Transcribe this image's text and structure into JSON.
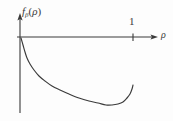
{
  "figure": {
    "name": "beta-function-plot",
    "background_color": "#fdfdfd",
    "line_color": "#3a3a3a",
    "y_axis_label_main": "f",
    "y_axis_label_subscript": "β",
    "y_axis_label_open_paren": "(",
    "y_axis_label_arg": "ρ",
    "y_axis_label_close_paren": ")",
    "x_axis_label": "ρ",
    "x_tick_label": "1"
  },
  "chart_data": {
    "type": "line",
    "title": "",
    "subtitle": "",
    "xlabel": "ρ",
    "ylabel": "f_β(ρ)",
    "grid": false,
    "legend": null,
    "axis_style": "arrowed-cartesian",
    "x_ticks": [
      {
        "value": 1,
        "label": "1",
        "px": 133
      }
    ],
    "y_ticks": [],
    "xlim": [
      0,
      1.18
    ],
    "ylim": [
      -1.0,
      0.24
    ],
    "origin_px": {
      "x": 20,
      "y": 37
    },
    "x_axis_px": {
      "x_start": 17,
      "x_end": 157,
      "y": 37
    },
    "y_axis_px": {
      "y_start": 14,
      "y_end": 113,
      "x": 20
    },
    "series": [
      {
        "name": "f_beta(rho)",
        "color": "#3a3a3a",
        "points_px": [
          {
            "x": 21,
            "y": 38
          },
          {
            "x": 23,
            "y": 45
          },
          {
            "x": 25,
            "y": 52
          },
          {
            "x": 27,
            "y": 58
          },
          {
            "x": 30,
            "y": 64
          },
          {
            "x": 34,
            "y": 70
          },
          {
            "x": 39,
            "y": 76
          },
          {
            "x": 45,
            "y": 81
          },
          {
            "x": 52,
            "y": 86
          },
          {
            "x": 60,
            "y": 90
          },
          {
            "x": 69,
            "y": 94
          },
          {
            "x": 79,
            "y": 98
          },
          {
            "x": 89,
            "y": 101
          },
          {
            "x": 98,
            "y": 103
          },
          {
            "x": 106,
            "y": 105
          },
          {
            "x": 112,
            "y": 105
          },
          {
            "x": 118,
            "y": 104
          },
          {
            "x": 123,
            "y": 102
          },
          {
            "x": 127,
            "y": 98
          },
          {
            "x": 130,
            "y": 94
          },
          {
            "x": 132,
            "y": 89
          },
          {
            "x": 133,
            "y": 85
          }
        ],
        "description": "Decreasing convex curve from the origin, reaching a minimum near rho = 0.85 then rising steeply toward rho = 1"
      }
    ]
  }
}
